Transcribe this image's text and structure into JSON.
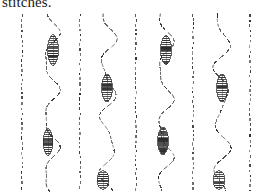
{
  "document": {
    "caption": "stitches.",
    "caption_clipped": true
  },
  "figure": {
    "title": "stitches",
    "background_color": "#ffffff",
    "ink_color": "#2b2b2b",
    "width": 272,
    "height": 193,
    "straight_lines": [
      {
        "id": "straight-1",
        "x": 22,
        "y_top": 14,
        "y_bottom": 191
      },
      {
        "id": "straight-2",
        "x": 80,
        "y_top": 14,
        "y_bottom": 191
      },
      {
        "id": "straight-3",
        "x": 136,
        "y_top": 14,
        "y_bottom": 191
      },
      {
        "id": "straight-4",
        "x": 193,
        "y_top": 14,
        "y_bottom": 191
      },
      {
        "id": "straight-5",
        "x": 250,
        "y_top": 14,
        "y_bottom": 191
      }
    ],
    "wavy_lines": [
      {
        "id": "wavy-1",
        "x_center": 51,
        "amplitude": 7,
        "y_top": 14,
        "y_bottom": 191,
        "stitches": [
          {
            "id": "stitch-1a",
            "cx": 53,
            "cy": 50,
            "length": 31,
            "width": 11,
            "bands": 16
          },
          {
            "id": "stitch-1b",
            "cx": 48,
            "cy": 142,
            "length": 27,
            "width": 10,
            "bands": 14
          }
        ]
      },
      {
        "id": "wavy-2",
        "x_center": 108,
        "amplitude": 7,
        "y_top": 14,
        "y_bottom": 191,
        "stitches": [
          {
            "id": "stitch-2a",
            "cx": 107,
            "cy": 88,
            "length": 28,
            "width": 11,
            "bands": 15
          },
          {
            "id": "stitch-2b",
            "cx": 103,
            "cy": 180,
            "length": 19,
            "width": 12,
            "bands": 9
          }
        ]
      },
      {
        "id": "wavy-3",
        "x_center": 165,
        "amplitude": 7,
        "y_top": 14,
        "y_bottom": 191,
        "stitches": [
          {
            "id": "stitch-3a",
            "cx": 166,
            "cy": 50,
            "length": 30,
            "width": 11,
            "bands": 16
          },
          {
            "id": "stitch-3b",
            "cx": 163,
            "cy": 141,
            "length": 28,
            "width": 11,
            "bands": 14
          }
        ]
      },
      {
        "id": "wavy-4",
        "x_center": 222,
        "amplitude": 7,
        "y_top": 14,
        "y_bottom": 191,
        "stitches": [
          {
            "id": "stitch-4a",
            "cx": 222,
            "cy": 88,
            "length": 28,
            "width": 11,
            "bands": 15
          },
          {
            "id": "stitch-4b",
            "cx": 219,
            "cy": 180,
            "length": 19,
            "width": 12,
            "bands": 9
          }
        ]
      }
    ],
    "stroke": {
      "dash_pattern": "2.2 2.4",
      "line_width": 1.05,
      "wavy_line_width": 1.05
    }
  }
}
